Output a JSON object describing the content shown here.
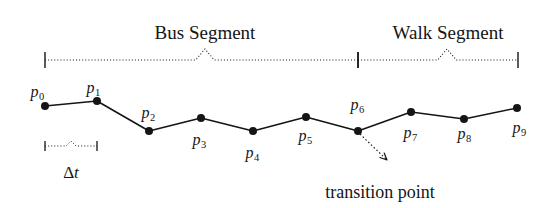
{
  "figure": {
    "background_color": "#ffffff",
    "ink_color": "#151515",
    "width": 552,
    "height": 208
  },
  "chart_data": {
    "type": "line",
    "title": "",
    "subtitle": "",
    "xlabel": "",
    "ylabel": "",
    "grid": false,
    "legend_position": "none",
    "point_labels": [
      "p0",
      "p1",
      "p2",
      "p3",
      "p4",
      "p5",
      "p6",
      "p7",
      "p8",
      "p9"
    ],
    "point_subscripts": [
      "0",
      "1",
      "2",
      "3",
      "4",
      "5",
      "6",
      "7",
      "8",
      "9"
    ],
    "x": [
      45,
      97,
      149,
      201,
      253,
      306,
      358,
      411,
      464,
      517
    ],
    "y": [
      106,
      101,
      131,
      118,
      131,
      117,
      131,
      112,
      119,
      108
    ],
    "marker": "filled-circle",
    "marker_radius": 4,
    "line_width": 1.6,
    "xlim": [
      0,
      552
    ],
    "ylim": [
      208,
      0
    ],
    "annotations": [
      {
        "name": "bus-segment",
        "label": "Bus Segment",
        "label_x": 205,
        "label_y": 23,
        "bracket_y": 60,
        "bracket_start_x": 45,
        "bracket_end_x": 358,
        "caret_x": 205,
        "caret_height": 11
      },
      {
        "name": "walk-segment",
        "label": "Walk Segment",
        "label_x": 448,
        "label_y": 23,
        "bracket_y": 60,
        "bracket_start_x": 358,
        "bracket_end_x": 518,
        "caret_x": 447,
        "caret_height": 11
      },
      {
        "name": "delta-t",
        "label_plain": "Δt",
        "label_delta": "Δ",
        "label_t": "t",
        "label_x": 71,
        "label_y": 172,
        "bracket_y": 146,
        "bracket_start_x": 45,
        "bracket_end_x": 97,
        "caret_x": 71,
        "caret_height": 5
      },
      {
        "name": "transition-point",
        "label": "transition point",
        "label_x": 380,
        "label_y": 183,
        "arrow_from_x": 360,
        "arrow_from_y": 134,
        "arrow_to_x": 387,
        "arrow_to_y": 160
      }
    ],
    "point_label_positions": [
      {
        "x": 37,
        "y": 92
      },
      {
        "x": 93,
        "y": 88
      },
      {
        "x": 148,
        "y": 113
      },
      {
        "x": 199,
        "y": 140
      },
      {
        "x": 252,
        "y": 153
      },
      {
        "x": 305,
        "y": 136
      },
      {
        "x": 357,
        "y": 105
      },
      {
        "x": 410,
        "y": 133
      },
      {
        "x": 464,
        "y": 134
      },
      {
        "x": 519,
        "y": 128
      }
    ]
  }
}
